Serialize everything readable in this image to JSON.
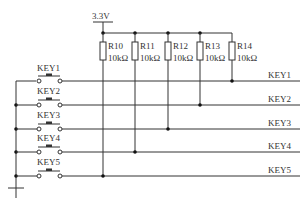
{
  "diagram": {
    "type": "circuit-schematic",
    "power": {
      "label": "3.3V"
    },
    "resistors": [
      {
        "ref": "R10",
        "value": "10kΩ",
        "net": "KEY5"
      },
      {
        "ref": "R11",
        "value": "10kΩ",
        "net": "KEY4"
      },
      {
        "ref": "R12",
        "value": "10kΩ",
        "net": "KEY3"
      },
      {
        "ref": "R13",
        "value": "10kΩ",
        "net": "KEY2"
      },
      {
        "ref": "R14",
        "value": "10kΩ",
        "net": "KEY1"
      }
    ],
    "switches": [
      {
        "label": "KEY1"
      },
      {
        "label": "KEY2"
      },
      {
        "label": "KEY3"
      },
      {
        "label": "KEY4"
      },
      {
        "label": "KEY5"
      }
    ],
    "nets": [
      {
        "label": "KEY1"
      },
      {
        "label": "KEY2"
      },
      {
        "label": "KEY3"
      },
      {
        "label": "KEY4"
      },
      {
        "label": "KEY5"
      }
    ],
    "ground": {
      "symbol": "ground"
    },
    "colors": {
      "wire": "#333333",
      "junction": "#111111",
      "background": "#ffffff"
    }
  }
}
